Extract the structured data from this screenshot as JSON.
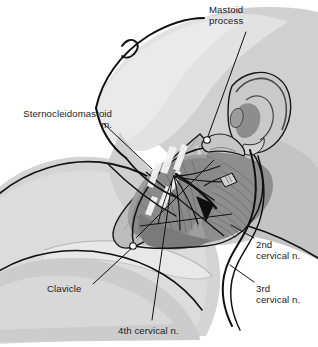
{
  "figure": {
    "background_color": "#ffffff",
    "ink_color": "#1b1b1b",
    "style": "grayscale medical line illustration"
  },
  "palette": {
    "outline": "#111111",
    "skin_light": "#e4e4e4",
    "skin_mid": "#d2d2d2",
    "skin_shadow": "#bdbdbd",
    "muscle_mid": "#a8a8a8",
    "muscle_dark": "#8c8c8c",
    "muscle_deep": "#6f6f6f",
    "highlight": "#f4f4f4",
    "marker_fill": "#101010",
    "circle_fill": "#ffffff"
  },
  "labels": [
    {
      "id": "mastoid-process",
      "line1": "Mastoid",
      "line2": "process",
      "align": "left",
      "x": 209,
      "y": 4
    },
    {
      "id": "sternocleidomastoid",
      "line1": "Sternocleidomastoid",
      "line2": "m.",
      "align": "right",
      "x": 7,
      "y": 108
    },
    {
      "id": "second-cervical-nerve",
      "line1": "2nd",
      "line2": "cervical n.",
      "align": "left",
      "x": 256,
      "y": 239
    },
    {
      "id": "third-cervical-nerve",
      "line1": "3rd",
      "line2": "cervical n.",
      "align": "left",
      "x": 256,
      "y": 283
    },
    {
      "id": "clavicle",
      "line1": "Clavicle",
      "line2": "",
      "align": "left",
      "x": 47,
      "y": 283
    },
    {
      "id": "fourth-cervical-nerve",
      "line1": "4th cervical n.",
      "line2": "",
      "align": "left",
      "x": 118,
      "y": 325
    }
  ],
  "anatomy_structures": [
    "head in profile tilted back",
    "external ear with helix antihelix concha tragus",
    "mandible and chin outline",
    "sternocleidomastoid muscle",
    "trapezius muscle",
    "clavicle",
    "deltoid and shoulder",
    "posterior cervical triangle",
    "cervical plexus nerve branches",
    "Erb's point marker"
  ],
  "leaders": [
    {
      "id": "mastoid-leader",
      "from": [
        246,
        32
      ],
      "to": [
        206,
        140
      ],
      "endpoint": "circle"
    },
    {
      "id": "scm-leader",
      "from": [
        104,
        124
      ],
      "to": [
        151,
        168
      ],
      "endpoint": "none"
    },
    {
      "id": "second-cervical-leader",
      "from": [
        253,
        238
      ],
      "to": [
        232,
        226
      ],
      "endpoint": "none"
    },
    {
      "id": "third-cervical-leader",
      "from": [
        253,
        282
      ],
      "to": [
        231,
        266
      ],
      "endpoint": "none"
    },
    {
      "id": "clavicle-leader",
      "from": [
        93,
        284
      ],
      "to": [
        133,
        246
      ],
      "endpoint": "none"
    },
    {
      "id": "fourth-cervical-leader",
      "from": [
        152,
        320
      ],
      "to": [
        171,
        182
      ],
      "endpoint": "none"
    }
  ]
}
